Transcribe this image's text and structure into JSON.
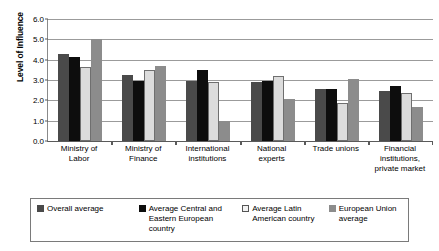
{
  "chart_data": {
    "type": "bar",
    "title": "",
    "xlabel": "",
    "ylabel": "Level of Influence",
    "ylim": [
      0.0,
      6.0
    ],
    "ytick_step": 1.0,
    "ytick_labels": [
      "6.0",
      "5.0",
      "4.0",
      "3.0",
      "2.0",
      "1.0",
      "0.0"
    ],
    "ytick_values": [
      6.0,
      5.0,
      4.0,
      3.0,
      2.0,
      1.0,
      0.0
    ],
    "grid": true,
    "legend_position": "bottom",
    "categories": [
      "Ministry of Labor",
      "Ministry of Finance",
      "International institutions",
      "National experts",
      "Trade unions",
      "Financial institutions, private market"
    ],
    "series": [
      {
        "name": "Overall average",
        "color": "#4a4a4a",
        "values": [
          4.3,
          3.25,
          2.95,
          2.92,
          2.58,
          2.48
        ]
      },
      {
        "name": "Average Central and Eastern European country",
        "color": "#0d0d0d",
        "values": [
          4.15,
          2.95,
          3.47,
          2.95,
          2.58,
          2.7
        ]
      },
      {
        "name": "Average Latin American country",
        "color": "#dcdcdc",
        "values": [
          3.65,
          3.5,
          2.88,
          3.18,
          1.85,
          2.37
        ]
      },
      {
        "name": "European Union average",
        "color": "#8c8c8c",
        "values": [
          5.0,
          3.7,
          1.0,
          2.05,
          3.03,
          1.68
        ]
      }
    ]
  },
  "axis": {
    "y_title": "Level of Influence"
  },
  "x_labels": [
    [
      "Ministry of",
      "Labor"
    ],
    [
      "Ministry of",
      "Finance"
    ],
    [
      "International",
      "institutions"
    ],
    [
      "National",
      "experts"
    ],
    [
      "Trade unions"
    ],
    [
      "Financial",
      "institutions,",
      "private market"
    ]
  ],
  "legend": {
    "items": [
      {
        "label": "Overall average",
        "color": "#4a4a4a"
      },
      {
        "label": "Average Central and Eastern European country",
        "color": "#0d0d0d"
      },
      {
        "label": "Average Latin American country",
        "color": "#dcdcdc"
      },
      {
        "label": "European Union average",
        "color": "#8c8c8c"
      }
    ]
  }
}
